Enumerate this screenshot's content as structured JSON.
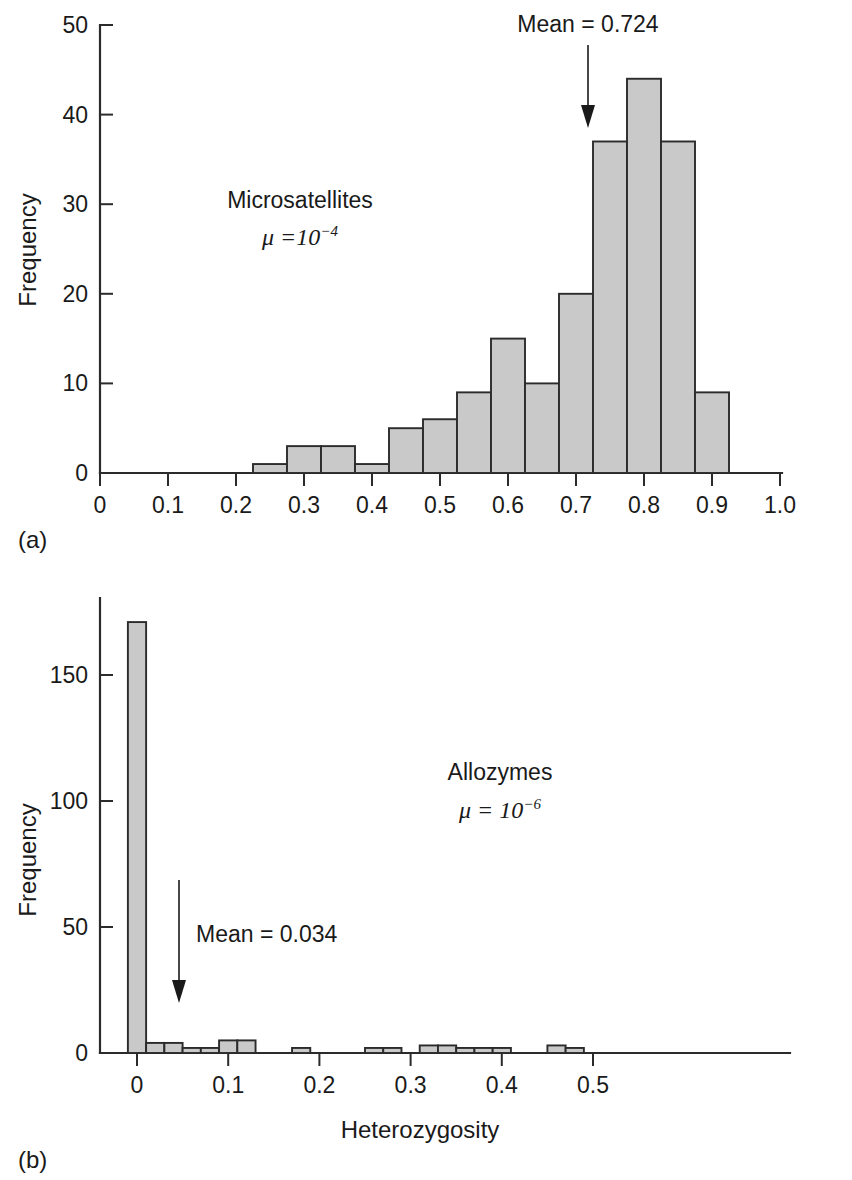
{
  "figure": {
    "background_color": "#ffffff",
    "bar_fill_color": "#c9c9c9",
    "bar_edge_color": "#2b2b2b",
    "axis_color": "#2b2b2b"
  },
  "panel_a": {
    "letter": "(a)",
    "annotation_title": "Microsatellites",
    "annotation_mu": "μ =10",
    "annotation_mu_exp": "−4",
    "mean_label": "Mean = 0.724",
    "mean_value": 0.724,
    "ylabel": "Frequency",
    "xlabel": "",
    "y_ticks": [
      "0",
      "10",
      "20",
      "30",
      "40",
      "50"
    ],
    "x_ticks": [
      "0",
      "0.1",
      "0.2",
      "0.3",
      "0.4",
      "0.5",
      "0.6",
      "0.7",
      "0.8",
      "0.9",
      "1.0"
    ]
  },
  "panel_b": {
    "letter": "(b)",
    "annotation_title": "Allozymes",
    "annotation_mu": "μ = 10",
    "annotation_mu_exp": "−6",
    "mean_label": "Mean = 0.034",
    "mean_value": 0.034,
    "ylabel": "Frequency",
    "xlabel": "Heterozygosity",
    "y_ticks": [
      "0",
      "50",
      "100",
      "150"
    ],
    "x_ticks": [
      "0",
      "0.1",
      "0.2",
      "0.3",
      "0.4",
      "0.5"
    ]
  },
  "chart_data": [
    {
      "type": "bar",
      "id": "panel-a-microsatellites",
      "title": "Microsatellites",
      "subtitle": "μ = 10^-4",
      "xlabel": "Heterozygosity",
      "ylabel": "Frequency",
      "xlim": [
        0,
        1.0
      ],
      "ylim": [
        0,
        50
      ],
      "grid": false,
      "legend": "none",
      "bin_width": 0.05,
      "bin_edges": [
        0.225,
        0.275,
        0.325,
        0.375,
        0.425,
        0.475,
        0.525,
        0.575,
        0.625,
        0.675,
        0.725,
        0.775,
        0.825,
        0.875,
        0.925
      ],
      "bin_centers": [
        0.25,
        0.3,
        0.35,
        0.4,
        0.45,
        0.5,
        0.55,
        0.6,
        0.65,
        0.7,
        0.75,
        0.8,
        0.85,
        0.9
      ],
      "values": [
        1,
        3,
        3,
        1,
        5,
        6,
        9,
        15,
        10,
        20,
        37,
        44,
        37,
        9
      ],
      "annotations": [
        {
          "text": "Mean = 0.724",
          "x": 0.724,
          "kind": "arrow-down"
        },
        {
          "text": "Microsatellites",
          "x": 0.33,
          "y": 32
        },
        {
          "text": "μ = 10⁻⁴",
          "x": 0.33,
          "y": 27
        }
      ]
    },
    {
      "type": "bar",
      "id": "panel-b-allozymes",
      "title": "Allozymes",
      "subtitle": "μ = 10^-6",
      "xlabel": "Heterozygosity",
      "ylabel": "Frequency",
      "xlim": [
        -0.015,
        0.545
      ],
      "ylim": [
        0,
        175
      ],
      "grid": false,
      "legend": "none",
      "bin_width": 0.02,
      "bin_edges": [
        -0.01,
        0.01,
        0.03,
        0.05,
        0.07,
        0.09,
        0.11,
        0.13,
        0.15,
        0.17,
        0.19,
        0.21,
        0.23,
        0.25,
        0.27,
        0.29,
        0.31,
        0.33,
        0.35,
        0.37,
        0.39,
        0.41,
        0.43,
        0.45,
        0.47,
        0.49,
        0.51,
        0.53
      ],
      "bin_centers": [
        0.0,
        0.02,
        0.04,
        0.06,
        0.08,
        0.1,
        0.12,
        0.14,
        0.16,
        0.18,
        0.2,
        0.22,
        0.24,
        0.26,
        0.28,
        0.3,
        0.32,
        0.34,
        0.36,
        0.38,
        0.4,
        0.42,
        0.44,
        0.46,
        0.48,
        0.5,
        0.52
      ],
      "values": [
        171,
        4,
        4,
        2,
        2,
        5,
        5,
        0,
        0,
        2,
        0,
        0,
        0,
        2,
        2,
        0,
        3,
        3,
        2,
        2,
        2,
        0,
        0,
        3,
        2,
        0,
        0
      ],
      "annotations": [
        {
          "text": "Mean = 0.034",
          "x": 0.034,
          "kind": "arrow-down"
        },
        {
          "text": "Allozymes",
          "x": 0.27,
          "y": 105
        },
        {
          "text": "μ = 10⁻⁶",
          "x": 0.27,
          "y": 92
        }
      ]
    }
  ]
}
